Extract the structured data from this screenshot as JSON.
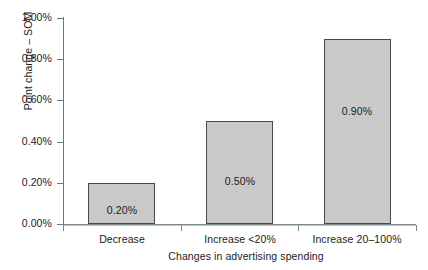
{
  "chart_data": {
    "type": "bar",
    "title": "",
    "xlabel": "Changes in advertising spending",
    "ylabel": "Point change – SOM",
    "categories": [
      "Decrease",
      "Increase <20%",
      "Increase 20–100%"
    ],
    "values": [
      0.2,
      0.5,
      0.9
    ],
    "value_labels": [
      "0.20%",
      "0.50%",
      "0.90%"
    ],
    "ylim": [
      0,
      1.0
    ],
    "ytick_values": [
      0.0,
      0.2,
      0.4,
      0.6,
      0.8,
      1.0
    ],
    "ytick_labels": [
      "0.00%",
      "0.20%",
      "0.40%",
      "0.60%",
      "0.80%",
      "1.00%"
    ],
    "grid": false,
    "legend": null,
    "bar_fill_color": "#c9c9c9",
    "bar_edge_color": "#4a4a4a",
    "axis_color": "#6f7775"
  }
}
